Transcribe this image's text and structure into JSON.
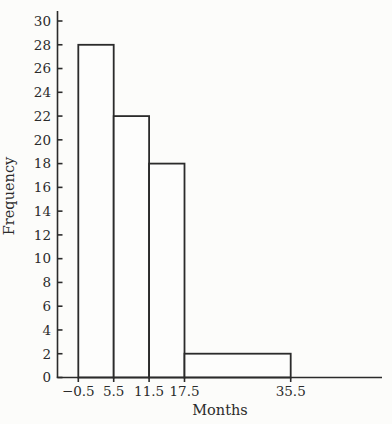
{
  "chart_data": {
    "type": "bar",
    "subtype": "histogram",
    "title": "",
    "xlabel": "Months",
    "ylabel": "Frequency",
    "bin_edges": [
      -0.5,
      5.5,
      11.5,
      17.5,
      35.5
    ],
    "frequencies": [
      28,
      22,
      18,
      2
    ],
    "x_tick_labels": [
      "−0.5",
      "5.5",
      "11.5",
      "17.5",
      "35.5"
    ],
    "y_ticks": [
      0,
      2,
      4,
      6,
      8,
      10,
      12,
      14,
      16,
      18,
      20,
      22,
      24,
      26,
      28,
      30
    ],
    "ylim": [
      0,
      30
    ],
    "grid": false,
    "legend": null,
    "colors": {
      "ink": "#2b2b2b",
      "background": "#fcfcfa",
      "bar_fill": "#fdfdfc"
    }
  }
}
